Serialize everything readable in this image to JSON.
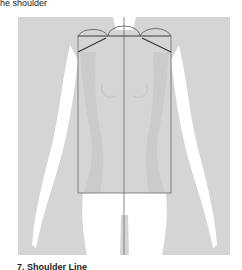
{
  "captions": {
    "top": "he shoulder",
    "bottom": "7. Shoulder Line"
  },
  "figure": {
    "colors": {
      "panel": "#d5d5d5",
      "torso_shade": "#cacaca",
      "body": "#ffffff",
      "lines": "#6a6a6a",
      "shoulder_lines": "#333333"
    }
  }
}
